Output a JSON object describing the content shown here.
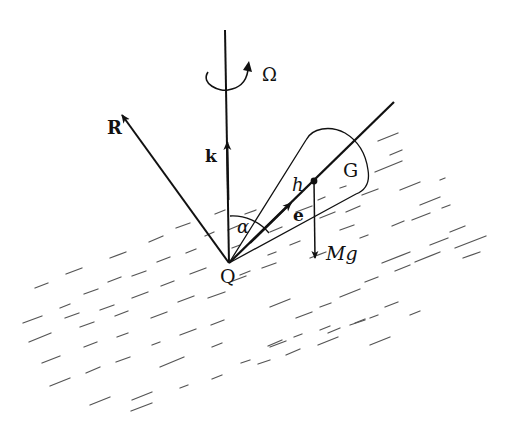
{
  "diagram": {
    "labels": {
      "omega": "Ω",
      "R": "R",
      "k": "k",
      "alpha": "α",
      "h": "h",
      "G": "G",
      "e": "e",
      "Mg": "Mg",
      "Q": "Q"
    },
    "colors": {
      "ink": "#111111",
      "hatch": "#555555",
      "background": "#ffffff"
    }
  }
}
